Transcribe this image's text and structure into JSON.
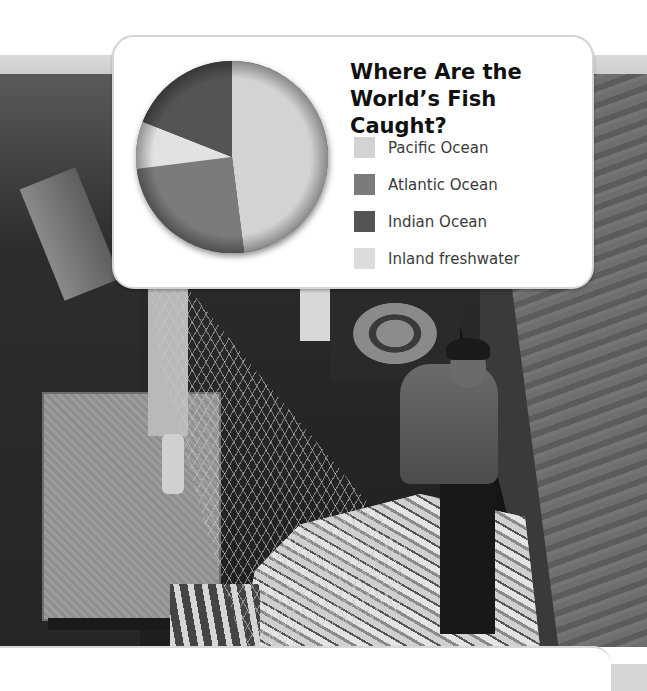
{
  "page": {
    "background": "#ffffff",
    "band_color": "#d4d4d4"
  },
  "photo": {
    "description": "Fishermen hauling a net full of fish onto a boat deck (black-and-white photograph)"
  },
  "chart_data": {
    "type": "pie",
    "title_lines": [
      "Where Are the",
      "World’s Fish Caught?"
    ],
    "categories": [
      "Pacific Ocean",
      "Atlantic Ocean",
      "Inland freshwater",
      "Indian Ocean"
    ],
    "series": [
      {
        "name": "Share of world fish catch (approx. %)",
        "values": [
          48,
          25,
          8,
          19
        ]
      }
    ],
    "slices": [
      {
        "label": "Pacific Ocean",
        "value": 48,
        "color": "#d3d3d3"
      },
      {
        "label": "Atlantic Ocean",
        "value": 25,
        "color": "#7b7b7b"
      },
      {
        "label": "Inland freshwater",
        "value": 8,
        "color": "#e2e2e2"
      },
      {
        "label": "Indian Ocean",
        "value": 19,
        "color": "#545454"
      }
    ],
    "start_angle": "12 o'clock",
    "direction": "clockwise",
    "legend": [
      {
        "label": "Pacific Ocean",
        "color": "#d3d3d3"
      },
      {
        "label": "Atlantic Ocean",
        "color": "#7b7b7b"
      },
      {
        "label": "Indian Ocean",
        "color": "#545454"
      },
      {
        "label": "Inland freshwater",
        "color": "#dcdcdc"
      }
    ],
    "legend_position": "right",
    "data_labels": false
  }
}
